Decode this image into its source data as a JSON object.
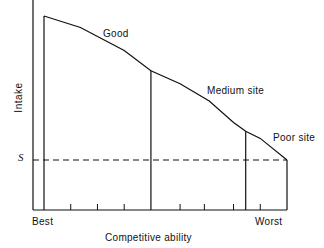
{
  "chart_data": {
    "type": "line",
    "title": "",
    "xlabel": "Competitive ability",
    "ylabel": "Intake",
    "x_tick_labels": [
      "Best",
      "Worst"
    ],
    "threshold": {
      "label": "S",
      "style": "dashed"
    },
    "site_labels": [
      "Good",
      "Medium site",
      "Poor site"
    ],
    "x": [
      0,
      0.15,
      0.33,
      0.44,
      0.56,
      0.68,
      0.78,
      0.83,
      0.89,
      1.0
    ],
    "series": [
      {
        "name": "Intake",
        "values": [
          1.0,
          0.92,
          0.76,
          0.62,
          0.53,
          0.41,
          0.26,
          0.2,
          0.15,
          0.0
        ]
      }
    ],
    "site_boundaries_x": [
      0.44,
      0.83,
      1.0
    ],
    "minor_ticks_x": [
      0.11,
      0.22,
      0.33,
      0.56,
      0.66,
      0.78,
      0.89
    ],
    "ylim_note": "values relative to threshold S (0) and maximum intake (1)"
  }
}
